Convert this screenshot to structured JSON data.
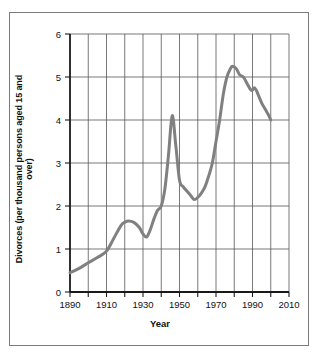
{
  "chart_data": {
    "type": "line",
    "title": "",
    "xlabel": "Year",
    "ylabel": "Divorces (per thousand persons aged 15 and over)",
    "xlim": [
      1890,
      2010
    ],
    "ylim": [
      0,
      6
    ],
    "xticks": [
      1890,
      1900,
      1910,
      1920,
      1930,
      1940,
      1950,
      1960,
      1970,
      1980,
      1990,
      2000,
      2010
    ],
    "xticklabels": [
      "1890",
      "",
      "1910",
      "",
      "1930",
      "",
      "1950",
      "",
      "1970",
      "",
      "1990",
      "",
      "2010"
    ],
    "xtick_labeled": [
      "1890",
      "1910",
      "1930",
      "1950",
      "1970",
      "1990",
      "2010"
    ],
    "yticks": [
      0,
      1,
      2,
      3,
      4,
      5,
      6
    ],
    "yticklabels": [
      "0",
      "1",
      "2",
      "3",
      "4",
      "5",
      "6"
    ],
    "grid": "both",
    "legend": "none",
    "series": [
      {
        "name": "Divorce rate",
        "color": "#808080",
        "linewidth": 3,
        "x": [
          1890,
          1895,
          1900,
          1905,
          1910,
          1914,
          1918,
          1920,
          1922,
          1925,
          1928,
          1930,
          1932,
          1934,
          1936,
          1938,
          1940,
          1942,
          1944,
          1946,
          1948,
          1950,
          1952,
          1954,
          1956,
          1958,
          1960,
          1962,
          1964,
          1966,
          1968,
          1970,
          1972,
          1974,
          1976,
          1978,
          1979,
          1981,
          1983,
          1985,
          1987,
          1989,
          1990,
          1991,
          1992,
          1993,
          1995,
          1997,
          1999,
          2000
        ],
        "y": [
          0.45,
          0.55,
          0.68,
          0.8,
          0.95,
          1.25,
          1.55,
          1.62,
          1.65,
          1.62,
          1.5,
          1.35,
          1.28,
          1.45,
          1.7,
          1.9,
          2.0,
          2.4,
          3.2,
          4.1,
          3.4,
          2.6,
          2.45,
          2.35,
          2.25,
          2.15,
          2.2,
          2.3,
          2.45,
          2.7,
          3.0,
          3.5,
          4.0,
          4.6,
          5.0,
          5.2,
          5.25,
          5.2,
          5.05,
          5.0,
          4.85,
          4.7,
          4.7,
          4.75,
          4.7,
          4.6,
          4.4,
          4.25,
          4.1,
          4.0
        ]
      }
    ]
  },
  "figure": {
    "axis_color": "#1a1a1a",
    "grid_color": "#555555",
    "border_color": "#7a7a7a",
    "background": "#ffffff"
  }
}
